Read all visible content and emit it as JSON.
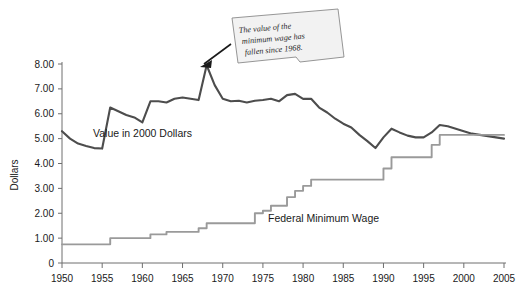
{
  "chart_data": {
    "type": "line",
    "title": "",
    "xlabel": "",
    "ylabel": "Dollars",
    "xlim": [
      1950,
      2005
    ],
    "ylim": [
      0,
      8
    ],
    "grid": false,
    "legend_position": "inline-labels",
    "xticks": [
      "1950",
      "1955",
      "1960",
      "1965",
      "1970",
      "1975",
      "1980",
      "1985",
      "1990",
      "1995",
      "2000",
      "2005"
    ],
    "yticks": [
      "0",
      "1.00",
      "2.00",
      "3.00",
      "4.00",
      "5.00",
      "6.00",
      "7.00",
      "8.00"
    ],
    "x": [
      1950,
      1951,
      1952,
      1953,
      1954,
      1955,
      1956,
      1957,
      1958,
      1959,
      1960,
      1961,
      1962,
      1963,
      1964,
      1965,
      1966,
      1967,
      1968,
      1969,
      1970,
      1971,
      1972,
      1973,
      1974,
      1975,
      1976,
      1977,
      1978,
      1979,
      1980,
      1981,
      1982,
      1983,
      1984,
      1985,
      1986,
      1987,
      1988,
      1989,
      1990,
      1991,
      1992,
      1993,
      1994,
      1995,
      1996,
      1997,
      1998,
      1999,
      2000,
      2001,
      2002,
      2003,
      2004,
      2005
    ],
    "series": [
      {
        "name": "Value in 2000 Dollars",
        "color": "#4d4d4d",
        "style": "smooth-line",
        "label_text": "Value in 2000 Dollars",
        "values": [
          5.3,
          5.0,
          4.8,
          4.7,
          4.62,
          4.6,
          6.25,
          6.1,
          5.95,
          5.85,
          5.65,
          6.5,
          6.5,
          6.45,
          6.6,
          6.65,
          6.6,
          6.55,
          7.95,
          7.15,
          6.6,
          6.5,
          6.52,
          6.45,
          6.52,
          6.55,
          6.6,
          6.5,
          6.75,
          6.8,
          6.6,
          6.6,
          6.25,
          6.05,
          5.8,
          5.6,
          5.45,
          5.15,
          4.9,
          4.62,
          5.05,
          5.4,
          5.25,
          5.12,
          5.05,
          5.05,
          5.25,
          5.55,
          5.5,
          5.4,
          5.3,
          5.2,
          5.15,
          5.1,
          5.05,
          5.0
        ]
      },
      {
        "name": "Federal Minimum Wage",
        "color": "#9a9a9a",
        "style": "step-line",
        "label_text": "Federal Minimum Wage",
        "values": [
          0.75,
          0.75,
          0.75,
          0.75,
          0.75,
          0.75,
          1.0,
          1.0,
          1.0,
          1.0,
          1.0,
          1.15,
          1.15,
          1.25,
          1.25,
          1.25,
          1.25,
          1.4,
          1.6,
          1.6,
          1.6,
          1.6,
          1.6,
          1.6,
          2.0,
          2.1,
          2.3,
          2.3,
          2.65,
          2.9,
          3.1,
          3.35,
          3.35,
          3.35,
          3.35,
          3.35,
          3.35,
          3.35,
          3.35,
          3.35,
          3.8,
          4.25,
          4.25,
          4.25,
          4.25,
          4.25,
          4.75,
          5.15,
          5.15,
          5.15,
          5.15,
          5.15,
          5.15,
          5.15,
          5.15,
          5.15
        ]
      }
    ],
    "annotations": [
      {
        "id": "callout",
        "lines": [
          "The value of the",
          "minimum wage has",
          "fallen since 1968."
        ],
        "points_to_year": 1968,
        "points_to_value": 7.95
      }
    ]
  }
}
